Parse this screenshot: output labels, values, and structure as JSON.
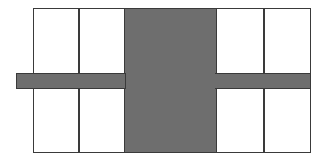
{
  "diagram": {
    "colors": {
      "outline": "#3a3a3a",
      "fill": "#6e6e6e",
      "background": "#ffffff"
    },
    "frame": {
      "x": 33,
      "y": 8,
      "width": 278,
      "height": 145
    },
    "dividers": [
      {
        "x": 78,
        "y": 8,
        "height": 145
      },
      {
        "x": 263,
        "y": 8,
        "height": 145
      }
    ],
    "center_block": {
      "x": 124,
      "y": 8,
      "width": 93,
      "height": 145
    },
    "horizontal_bar": {
      "x": 16,
      "y": 73,
      "width": 295,
      "height": 16
    },
    "cells": [
      {
        "id": "top-left-outer"
      },
      {
        "id": "top-left-inner"
      },
      {
        "id": "top-right-inner"
      },
      {
        "id": "top-right-outer"
      },
      {
        "id": "bottom-left-outer"
      },
      {
        "id": "bottom-left-inner"
      },
      {
        "id": "bottom-right-inner"
      },
      {
        "id": "bottom-right-outer"
      }
    ]
  }
}
